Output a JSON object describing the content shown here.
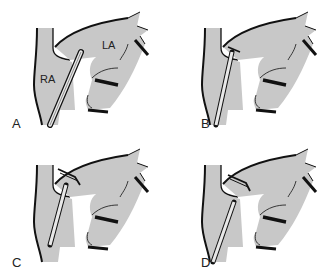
{
  "figure": {
    "panels": [
      {
        "id": "A",
        "label": "A",
        "annotations": [
          "RA",
          "LA"
        ],
        "stage": "catheter tip against atrial wall"
      },
      {
        "id": "B",
        "label": "B",
        "annotations": [],
        "stage": "catheter crossing septum with device"
      },
      {
        "id": "C",
        "label": "C",
        "annotations": [],
        "stage": "device deployed, catheter retracting"
      },
      {
        "id": "D",
        "label": "D",
        "annotations": [],
        "stage": "device in place, catheter withdrawn"
      }
    ],
    "labels": {
      "A": "A",
      "B": "B",
      "C": "C",
      "D": "D",
      "RA": "RA",
      "LA": "LA"
    },
    "colors": {
      "fill": "#c8c8c8",
      "stroke": "#111111",
      "background": "#ffffff"
    }
  }
}
